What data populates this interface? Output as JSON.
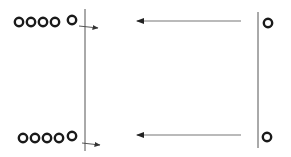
{
  "diagram": {
    "colors": {
      "ink": "#1a1a1a",
      "line": "#555555",
      "arrow": "#666666",
      "background": "#ffffff"
    },
    "left_line": {
      "x": 85,
      "y1": 9,
      "y2": 151
    },
    "right_line": {
      "x": 258,
      "y1": 12,
      "y2": 148
    },
    "rows": [
      {
        "id": "top",
        "circles": [
          {
            "cx": 19,
            "cy": 22
          },
          {
            "cx": 31,
            "cy": 22
          },
          {
            "cx": 43,
            "cy": 22
          },
          {
            "cx": 55,
            "cy": 22
          },
          {
            "cx": 72,
            "cy": 20
          }
        ],
        "short_arrow": {
          "x1": 79,
          "y1": 26,
          "x2": 98,
          "y2": 28
        },
        "long_arrow": {
          "x1": 241,
          "y1": 21,
          "x2": 137,
          "y2": 21
        },
        "right_circle": {
          "cx": 268,
          "cy": 23
        }
      },
      {
        "id": "bottom",
        "circles": [
          {
            "cx": 23,
            "cy": 138
          },
          {
            "cx": 35,
            "cy": 138
          },
          {
            "cx": 47,
            "cy": 138
          },
          {
            "cx": 59,
            "cy": 138
          },
          {
            "cx": 72,
            "cy": 136
          }
        ],
        "short_arrow": {
          "x1": 82,
          "y1": 143,
          "x2": 100,
          "y2": 145
        },
        "long_arrow": {
          "x1": 241,
          "y1": 135,
          "x2": 137,
          "y2": 135
        },
        "right_circle": {
          "cx": 267,
          "cy": 137
        }
      }
    ],
    "circle_radius": 4.2,
    "circle_stroke_width": 2.4
  }
}
